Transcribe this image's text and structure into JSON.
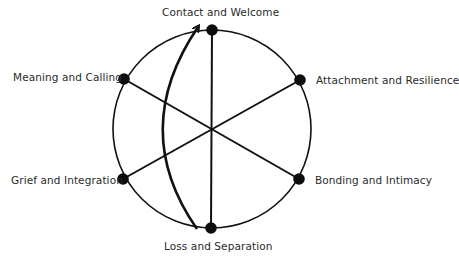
{
  "diagram": {
    "title": "",
    "colors": {
      "stroke": "#111111",
      "node": "#0d0d0d",
      "label": "#2a2a2a",
      "background": "#ffffff"
    },
    "circle": {
      "cx": 212,
      "cy": 129,
      "r": 99
    },
    "center": {
      "x": 212,
      "y": 128
    },
    "nodes": [
      {
        "id": "contact",
        "label": "Contact and Welcome",
        "x": 212,
        "y": 30,
        "label_x": 162,
        "label_y": 6
      },
      {
        "id": "attachment",
        "label": "Attachment and Resilience",
        "x": 300,
        "y": 80,
        "label_x": 316,
        "label_y": 74
      },
      {
        "id": "bonding",
        "label": "Bonding and Intimacy",
        "x": 299,
        "y": 179,
        "label_x": 315,
        "label_y": 174
      },
      {
        "id": "loss",
        "label": "Loss and Separation",
        "x": 211,
        "y": 228,
        "label_x": 164,
        "label_y": 240
      },
      {
        "id": "grief",
        "label": "Grief and Integration",
        "x": 123,
        "y": 179,
        "label_x": 11,
        "label_y": 174
      },
      {
        "id": "meaning",
        "label": "Meaning and Calling",
        "x": 124,
        "y": 79,
        "label_x": 13,
        "label_y": 71
      }
    ],
    "spokes": [
      {
        "from": "contact",
        "to": "loss"
      },
      {
        "from": "meaning",
        "to": "bonding"
      },
      {
        "from": "grief",
        "to": "attachment"
      }
    ],
    "arrow": {
      "description": "curved arrow from Loss and Separation to Contact and Welcome",
      "start": {
        "x": 197,
        "y": 229
      },
      "control": {
        "x": 128,
        "y": 130
      },
      "end": {
        "x": 198,
        "y": 27
      }
    }
  }
}
